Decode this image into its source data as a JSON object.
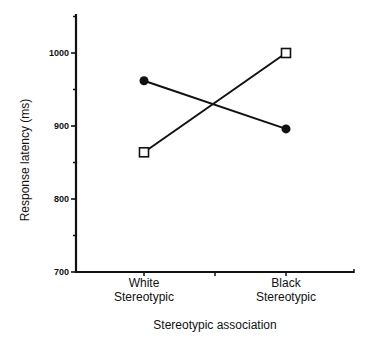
{
  "chart_data": {
    "type": "line",
    "title": "",
    "xlabel": "Stereotypic association",
    "ylabel": "Response latency (ms)",
    "categories": [
      {
        "line1": "White",
        "line2": "Stereotypic"
      },
      {
        "line1": "Black",
        "line2": "Stereotypic"
      }
    ],
    "ylim": [
      700,
      1050
    ],
    "yticks": [
      700,
      800,
      900,
      1000
    ],
    "yticks_minor": [
      750,
      850,
      950,
      1050
    ],
    "grid": false,
    "legend": null,
    "series": [
      {
        "name": "filled-circle series",
        "marker": "filled-circle",
        "values": [
          962,
          896
        ]
      },
      {
        "name": "open-square series",
        "marker": "open-square",
        "values": [
          864,
          1000
        ]
      }
    ]
  },
  "colors": {
    "ink": "#111111",
    "background": "#ffffff"
  }
}
